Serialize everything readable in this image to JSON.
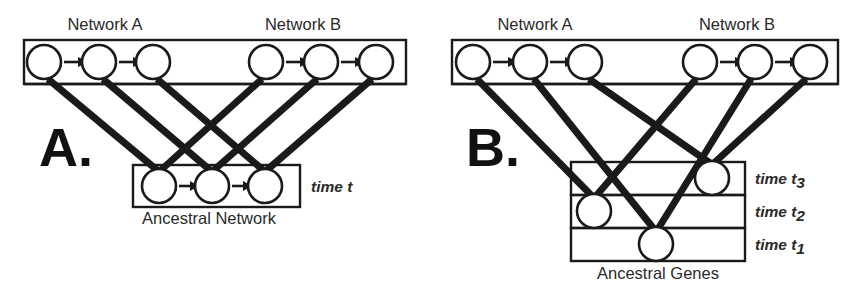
{
  "figure": {
    "kind": "two-panel-schematic",
    "background_color": "#ffffff",
    "ink_color": "#1a1a1a",
    "node_fill": "#ffffff"
  },
  "panel_a": {
    "letter": "A.",
    "top_label_left": "Network A",
    "top_label_right": "Network B",
    "bottom_box_label": "Ancestral Network",
    "time_label": "time t",
    "time_sub": "",
    "top_nodes": [
      {
        "id": "a-top-1",
        "cx": 44,
        "cy": 62,
        "r": 17,
        "group": "Network A"
      },
      {
        "id": "a-top-2",
        "cx": 99,
        "cy": 62,
        "r": 17,
        "group": "Network A"
      },
      {
        "id": "a-top-3",
        "cx": 153,
        "cy": 62,
        "r": 17,
        "group": "Network A"
      },
      {
        "id": "a-top-4",
        "cx": 266,
        "cy": 62,
        "r": 17,
        "group": "Network B"
      },
      {
        "id": "a-top-5",
        "cx": 321,
        "cy": 62,
        "r": 17,
        "group": "Network B"
      },
      {
        "id": "a-top-6",
        "cx": 376,
        "cy": 62,
        "r": 17,
        "group": "Network B"
      }
    ],
    "bottom_nodes": [
      {
        "id": "a-bot-1",
        "cx": 159,
        "cy": 186,
        "r": 17
      },
      {
        "id": "a-bot-2",
        "cx": 212,
        "cy": 186,
        "r": 17
      },
      {
        "id": "a-bot-3",
        "cx": 265,
        "cy": 186,
        "r": 17
      }
    ],
    "top_box": {
      "x": 24,
      "y": 40,
      "width": 382,
      "height": 44
    },
    "bottom_box": {
      "x": 133,
      "y": 165,
      "width": 167,
      "height": 42
    },
    "top_arrows": [
      {
        "from": "a-top-1",
        "to": "a-top-2",
        "x1": 64,
        "x2": 80,
        "y": 62
      },
      {
        "from": "a-top-2",
        "to": "a-top-3",
        "x1": 119,
        "x2": 135,
        "y": 62
      },
      {
        "from": "a-top-4",
        "to": "a-top-5",
        "x1": 286,
        "x2": 302,
        "y": 62
      },
      {
        "from": "a-top-5",
        "to": "a-top-6",
        "x1": 341,
        "x2": 357,
        "y": 62
      }
    ],
    "bottom_arrows": [
      {
        "from": "a-bot-1",
        "to": "a-bot-2",
        "x1": 179,
        "x2": 193,
        "y": 186
      },
      {
        "from": "a-bot-2",
        "to": "a-bot-3",
        "x1": 232,
        "x2": 246,
        "y": 186
      }
    ],
    "lineage_edges": [
      {
        "from": "a-top-1",
        "to": "a-bot-1",
        "x1": 48,
        "y1": 79,
        "x2": 157,
        "y2": 170
      },
      {
        "from": "a-top-2",
        "to": "a-bot-2",
        "x1": 103,
        "y1": 79,
        "x2": 210,
        "y2": 170
      },
      {
        "from": "a-top-3",
        "to": "a-bot-3",
        "x1": 157,
        "y1": 79,
        "x2": 263,
        "y2": 170
      },
      {
        "from": "a-top-4",
        "to": "a-bot-1",
        "x1": 262,
        "y1": 79,
        "x2": 161,
        "y2": 170
      },
      {
        "from": "a-top-5",
        "to": "a-bot-2",
        "x1": 317,
        "y1": 79,
        "x2": 214,
        "y2": 170
      },
      {
        "from": "a-top-6",
        "to": "a-bot-3",
        "x1": 372,
        "y1": 79,
        "x2": 267,
        "y2": 170
      }
    ]
  },
  "panel_b": {
    "letter": "B.",
    "top_label_left": "Network A",
    "top_label_right": "Network B",
    "bottom_box_label": "Ancestral Genes",
    "time_rows": [
      {
        "id": "t3",
        "label": "time t",
        "sub": "3",
        "y": 162,
        "height": 33,
        "label_y": 184
      },
      {
        "id": "t2",
        "label": "time t",
        "sub": "2",
        "y": 195,
        "height": 33,
        "label_y": 217
      },
      {
        "id": "t1",
        "label": "time t",
        "sub": "1",
        "y": 228,
        "height": 33,
        "label_y": 250
      }
    ],
    "top_nodes": [
      {
        "id": "b-top-1",
        "cx": 46,
        "cy": 62,
        "r": 17,
        "group": "Network A"
      },
      {
        "id": "b-top-2",
        "cx": 103,
        "cy": 62,
        "r": 17,
        "group": "Network A"
      },
      {
        "id": "b-top-3",
        "cx": 158,
        "cy": 62,
        "r": 17,
        "group": "Network A"
      },
      {
        "id": "b-top-4",
        "cx": 273,
        "cy": 62,
        "r": 17,
        "group": "Network B"
      },
      {
        "id": "b-top-5",
        "cx": 328,
        "cy": 62,
        "r": 17,
        "group": "Network B"
      },
      {
        "id": "b-top-6",
        "cx": 383,
        "cy": 62,
        "r": 17,
        "group": "Network B"
      }
    ],
    "ancestral_nodes": [
      {
        "id": "b-gene-t3",
        "cx": 285,
        "cy": 178,
        "r": 17,
        "row": "t3"
      },
      {
        "id": "b-gene-t2",
        "cx": 167,
        "cy": 211,
        "r": 17,
        "row": "t2"
      },
      {
        "id": "b-gene-t1",
        "cx": 229,
        "cy": 244,
        "r": 17,
        "row": "t1"
      }
    ],
    "top_box": {
      "x": 25,
      "y": 40,
      "width": 386,
      "height": 44
    },
    "genes_box": {
      "x": 144,
      "y": 162,
      "width": 174,
      "height": 99
    },
    "top_arrows": [
      {
        "from": "b-top-1",
        "to": "b-top-2",
        "x1": 66,
        "x2": 83,
        "y": 62
      },
      {
        "from": "b-top-2",
        "to": "b-top-3",
        "x1": 123,
        "x2": 140,
        "y": 62
      },
      {
        "from": "b-top-4",
        "to": "b-top-5",
        "x1": 293,
        "x2": 310,
        "y": 62
      },
      {
        "from": "b-top-5",
        "to": "b-top-6",
        "x1": 348,
        "x2": 365,
        "y": 62
      }
    ],
    "lineage_edges": [
      {
        "from": "b-top-1",
        "to": "b-gene-t2",
        "x1": 50,
        "y1": 79,
        "x2": 165,
        "y2": 196
      },
      {
        "from": "b-top-2",
        "to": "b-gene-t1",
        "x1": 107,
        "y1": 79,
        "x2": 227,
        "y2": 229
      },
      {
        "from": "b-top-3",
        "to": "b-gene-t3",
        "x1": 162,
        "y1": 79,
        "x2": 283,
        "y2": 163
      },
      {
        "from": "b-top-4",
        "to": "b-gene-t2",
        "x1": 269,
        "y1": 79,
        "x2": 169,
        "y2": 196
      },
      {
        "from": "b-top-5",
        "to": "b-gene-t1",
        "x1": 324,
        "y1": 79,
        "x2": 231,
        "y2": 229
      },
      {
        "from": "b-top-6",
        "to": "b-gene-t3",
        "x1": 379,
        "y1": 79,
        "x2": 287,
        "y2": 163
      }
    ]
  }
}
